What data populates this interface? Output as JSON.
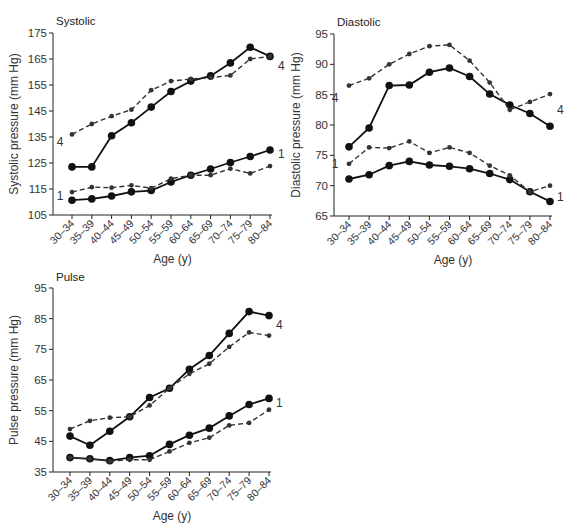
{
  "chart_data": [
    {
      "type": "line",
      "title": "Systolic",
      "xlabel": "Age (y)",
      "ylabel": "Systolic pressure (mm Hg)",
      "ylim": [
        105,
        175
      ],
      "yticks": [
        105,
        115,
        125,
        135,
        145,
        155,
        165,
        175
      ],
      "grid": false,
      "categories": [
        "30–34",
        "35–39",
        "40–44",
        "45–49",
        "50–54",
        "55–59",
        "60–64",
        "65–69",
        "70–74",
        "75–79",
        "80–84"
      ],
      "series": [
        {
          "name": "4 (solid)",
          "style": "solid",
          "label": "4",
          "values": [
            123.5,
            123.5,
            135.5,
            140.5,
            146.5,
            152.5,
            156.5,
            158.5,
            163.5,
            169.5,
            166
          ]
        },
        {
          "name": "4 (dashed)",
          "style": "dashed",
          "label": "4",
          "values": [
            136,
            140,
            143,
            145.5,
            153,
            156.5,
            157.3,
            157.8,
            158.7,
            165,
            166
          ]
        },
        {
          "name": "1 (solid)",
          "style": "solid",
          "label": "1",
          "values": [
            110.7,
            111.2,
            112.3,
            113.9,
            114.4,
            117.7,
            120.3,
            122.7,
            125.2,
            127.5,
            130
          ]
        },
        {
          "name": "1 (dashed)",
          "style": "dashed",
          "label": "1",
          "values": [
            113.8,
            115.7,
            115.5,
            116.4,
            115.3,
            119,
            120.3,
            120.3,
            122.8,
            121,
            123.8
          ]
        }
      ],
      "annotations": [
        {
          "text": "4",
          "series": "start-left",
          "value": 133
        },
        {
          "text": "4",
          "series": "end-right",
          "value": 162.5
        },
        {
          "text": "1",
          "series": "start-left",
          "value": 112.5
        },
        {
          "text": "1",
          "series": "end-right",
          "value": 128.5
        }
      ]
    },
    {
      "type": "line",
      "title": "Diastolic",
      "xlabel": "Age (y)",
      "ylabel": "Diastolic pressure (mm Hg)",
      "ylim": [
        65,
        95
      ],
      "yticks": [
        65,
        70,
        75,
        80,
        85,
        90,
        95
      ],
      "grid": false,
      "categories": [
        "30–34",
        "35–39",
        "40–44",
        "45–49",
        "50–54",
        "55–59",
        "60–64",
        "65–69",
        "70–74",
        "75–79",
        "80–84"
      ],
      "series": [
        {
          "name": "4 (solid)",
          "style": "solid",
          "label": "4",
          "values": [
            76.4,
            79.5,
            86.5,
            86.6,
            88.7,
            89.4,
            88,
            85.1,
            83.3,
            81.9,
            79.8
          ]
        },
        {
          "name": "4 (dashed)",
          "style": "dashed",
          "label": "4",
          "values": [
            86.5,
            87.7,
            90,
            91.7,
            93,
            93.2,
            90.6,
            87,
            82.5,
            83.8,
            85.1
          ]
        },
        {
          "name": "1 (solid)",
          "style": "solid",
          "label": "1",
          "values": [
            71.1,
            71.8,
            73.3,
            74,
            73.4,
            73.2,
            72.8,
            72,
            71,
            69,
            67.4
          ]
        },
        {
          "name": "1 (dashed)",
          "style": "dashed",
          "label": "1",
          "values": [
            73.6,
            76.3,
            76.2,
            77.3,
            75.4,
            76.3,
            75.4,
            73.3,
            71.7,
            69,
            70
          ]
        }
      ],
      "annotations": [
        {
          "text": "4",
          "series": "start-left",
          "value": 84.5
        },
        {
          "text": "4",
          "series": "end-right",
          "value": 82.5
        },
        {
          "text": "1",
          "series": "start-left",
          "value": 73.6
        },
        {
          "text": "1",
          "series": "end-right",
          "value": 68.2
        }
      ]
    },
    {
      "type": "line",
      "title": "Pulse",
      "xlabel": "Age (y)",
      "ylabel": "Pulse pressure (mm Hg)",
      "ylim": [
        35,
        95
      ],
      "yticks": [
        35,
        45,
        55,
        65,
        75,
        85,
        95
      ],
      "grid": false,
      "categories": [
        "30–34",
        "35–39",
        "40–44",
        "45–49",
        "50–54",
        "55–59",
        "60–64",
        "65–69",
        "70–74",
        "75–79",
        "80–84"
      ],
      "series": [
        {
          "name": "4 (solid)",
          "style": "solid",
          "label": "4",
          "values": [
            46.7,
            43.7,
            48.3,
            53,
            59.3,
            62.3,
            68.5,
            73,
            80.2,
            87.3,
            86
          ]
        },
        {
          "name": "4 (dashed)",
          "style": "dashed",
          "label": "4",
          "values": [
            49,
            51.7,
            52.7,
            53,
            56.7,
            62.3,
            67,
            70.3,
            75.8,
            80.5,
            79.5
          ]
        },
        {
          "name": "1 (solid)",
          "style": "solid",
          "label": "1",
          "values": [
            39.7,
            39.3,
            38.7,
            39.7,
            40.3,
            44,
            47,
            49.3,
            53.3,
            57,
            59
          ]
        },
        {
          "name": "1 (dashed)",
          "style": "dashed",
          "label": "1",
          "values": [
            39.7,
            39.3,
            38.5,
            39,
            39,
            41.7,
            44.5,
            46.2,
            50.2,
            51,
            55.3
          ]
        }
      ],
      "annotations": [
        {
          "text": "4",
          "series": "end-right",
          "value": 83
        },
        {
          "text": "1",
          "series": "end-right",
          "value": 57.5
        }
      ]
    }
  ]
}
